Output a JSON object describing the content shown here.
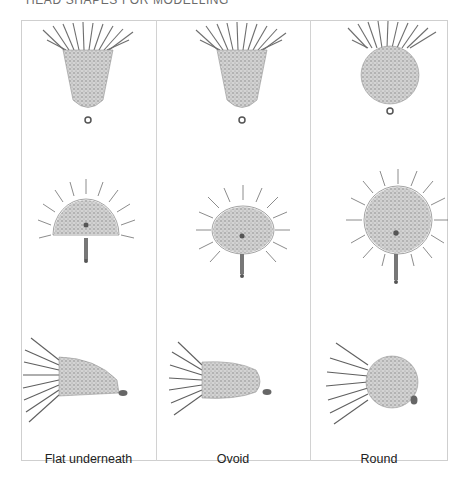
{
  "heading": "HEAD SHAPES FOR MODELLING",
  "columns": [
    {
      "id": "flat",
      "label": "Flat underneath",
      "views": [
        "front",
        "end-on",
        "side"
      ]
    },
    {
      "id": "ovoid",
      "label": "Ovoid",
      "views": [
        "front",
        "end-on",
        "side"
      ]
    },
    {
      "id": "round",
      "label": "Round",
      "views": [
        "front",
        "end-on",
        "side"
      ]
    }
  ],
  "colors": {
    "frame": "#cfcfcf",
    "body_fill": "#bdbdbd",
    "hackle": "#4a4a4a",
    "text": "#222222"
  }
}
